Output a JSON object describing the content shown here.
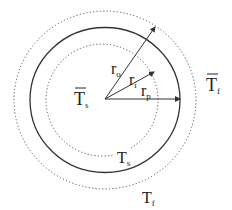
{
  "diagram": {
    "type": "concentric-circles",
    "colors": {
      "stroke": "#333333",
      "text": "#222222",
      "background": "#ffffff"
    },
    "center": {
      "x": 105,
      "y": 99
    },
    "circles": [
      {
        "name": "outer-dotted",
        "style": "dotted",
        "rx": 91,
        "ry": 89
      },
      {
        "name": "solid-boundary",
        "style": "solid",
        "rx": 75,
        "ry": 72
      },
      {
        "name": "inner-dotted",
        "style": "dotted",
        "rx": 56,
        "ry": 56
      }
    ],
    "arrows": [
      {
        "name": "r_o",
        "base": "r",
        "sub": "o",
        "tip": [
          155,
          27
        ]
      },
      {
        "name": "r_i",
        "base": "r",
        "sub": "i",
        "tip": [
          154,
          72
        ]
      },
      {
        "name": "r_p",
        "base": "r",
        "sub": "p",
        "tip": [
          180,
          99
        ]
      }
    ],
    "labels": {
      "ts_bar": {
        "base": "T",
        "sub": "s",
        "overbar": true
      },
      "tf_bar": {
        "base": "T",
        "sub": "f",
        "overbar": true
      },
      "ts": {
        "base": "T",
        "sub": "s"
      },
      "tf": {
        "base": "T",
        "sub": "f"
      },
      "r_o": {
        "base": "r",
        "sub": "o"
      },
      "r_i": {
        "base": "r",
        "sub": "i"
      },
      "r_p": {
        "base": "r",
        "sub": "p"
      }
    }
  }
}
